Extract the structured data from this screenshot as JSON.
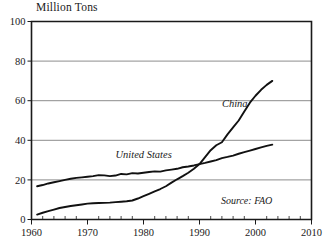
{
  "chart_data": {
    "type": "line",
    "title": "Million Tons",
    "xlabel": "",
    "ylabel": "Million Tons",
    "xlim": [
      1960,
      2010
    ],
    "ylim": [
      0,
      100
    ],
    "grid": true,
    "legend_position": "inline-annotation",
    "x_ticks": [
      "1960",
      "1970",
      "1980",
      "1990",
      "2000",
      "2010"
    ],
    "x_tick_values": [
      1960,
      1970,
      1980,
      1990,
      2000,
      2010
    ],
    "y_ticks": [
      "0",
      "20",
      "40",
      "60",
      "80",
      "100"
    ],
    "y_tick_values": [
      0,
      20,
      40,
      60,
      80,
      100
    ],
    "x_minor_tick_step": 2,
    "annotations": [
      {
        "name": "china-series-label",
        "text": "China",
        "x": 1994,
        "y": 57
      },
      {
        "name": "united-states-series-label",
        "text": "United States",
        "x": 1975,
        "y": 31
      },
      {
        "name": "source-note",
        "text": "Source: FAO",
        "x": 2003,
        "y": 8
      }
    ],
    "series": [
      {
        "name": "China",
        "color": "#111111",
        "x": [
          1961,
          1962,
          1963,
          1964,
          1965,
          1966,
          1967,
          1968,
          1969,
          1970,
          1971,
          1972,
          1973,
          1974,
          1975,
          1976,
          1977,
          1978,
          1979,
          1980,
          1981,
          1982,
          1983,
          1984,
          1985,
          1986,
          1987,
          1988,
          1989,
          1990,
          1991,
          1992,
          1993,
          1994,
          1995,
          1996,
          1997,
          1998,
          1999,
          2000,
          2001,
          2002,
          2003
        ],
        "values": [
          2.5,
          3.4,
          4.2,
          5.0,
          5.8,
          6.3,
          6.8,
          7.2,
          7.6,
          8.0,
          8.2,
          8.3,
          8.4,
          8.5,
          8.8,
          9.0,
          9.2,
          9.6,
          10.6,
          11.8,
          13.0,
          14.2,
          15.4,
          16.8,
          18.6,
          20.3,
          21.9,
          23.6,
          25.6,
          28.0,
          31.5,
          35.0,
          37.5,
          39.0,
          43.0,
          46.5,
          50.0,
          54.5,
          59.0,
          62.5,
          65.5,
          68.0,
          70.0
        ]
      },
      {
        "name": "United States",
        "color": "#111111",
        "x": [
          1961,
          1962,
          1963,
          1964,
          1965,
          1966,
          1967,
          1968,
          1969,
          1970,
          1971,
          1972,
          1973,
          1974,
          1975,
          1976,
          1977,
          1978,
          1979,
          1980,
          1981,
          1982,
          1983,
          1984,
          1985,
          1986,
          1987,
          1988,
          1989,
          1990,
          1991,
          1992,
          1993,
          1994,
          1995,
          1996,
          1997,
          1998,
          1999,
          2000,
          2001,
          2002,
          2003
        ],
        "values": [
          16.8,
          17.4,
          18.2,
          18.8,
          19.4,
          20.0,
          20.6,
          21.0,
          21.3,
          21.6,
          21.9,
          22.4,
          22.3,
          21.9,
          22.2,
          23.0,
          22.8,
          23.4,
          23.2,
          23.6,
          24.0,
          24.3,
          24.2,
          24.8,
          25.2,
          25.6,
          26.4,
          26.8,
          27.3,
          28.0,
          28.6,
          29.3,
          30.0,
          31.0,
          31.6,
          32.3,
          33.2,
          34.0,
          34.8,
          35.6,
          36.4,
          37.2,
          37.8
        ]
      }
    ]
  }
}
